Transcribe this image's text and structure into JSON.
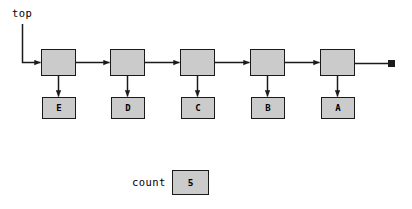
{
  "diagram": {
    "title_label": "top",
    "count_label": "count",
    "count_value": "5",
    "terminator": "null-terminator",
    "colors": {
      "box_fill": "#cbcbcb",
      "box_border": "#1a1a1a",
      "line": "#1a1a1a",
      "shadow": "#5a5a5a",
      "background": "#ffffff"
    },
    "nodes": [
      {
        "data": "E",
        "node_x": 41,
        "data_x": 42
      },
      {
        "data": "D",
        "node_x": 110,
        "data_x": 111
      },
      {
        "data": "C",
        "node_x": 180,
        "data_x": 181
      },
      {
        "data": "B",
        "node_x": 250,
        "data_x": 251
      },
      {
        "data": "A",
        "node_x": 320,
        "data_x": 321
      }
    ]
  }
}
